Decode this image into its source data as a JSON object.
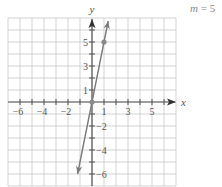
{
  "chart_data": {
    "type": "line",
    "title": "",
    "equation": "y = 5x",
    "annotation": {
      "text_var": "m",
      "text_eq": " = ",
      "text_val": "5"
    },
    "xlabel": "x",
    "ylabel": "y",
    "xlim": [
      -7,
      7
    ],
    "ylim": [
      -7,
      7
    ],
    "grid": true,
    "x_tick_labels": [
      {
        "value": -6,
        "label": "−6"
      },
      {
        "value": -4,
        "label": "−4"
      },
      {
        "value": -2,
        "label": "−2"
      },
      {
        "value": 1,
        "label": "1"
      },
      {
        "value": 3,
        "label": "3"
      },
      {
        "value": 5,
        "label": "5"
      }
    ],
    "y_tick_labels": [
      {
        "value": 5,
        "label": "5"
      },
      {
        "value": 3,
        "label": "3"
      },
      {
        "value": 1,
        "label": "1"
      },
      {
        "value": -2,
        "label": "−2"
      },
      {
        "value": -4,
        "label": "−4"
      },
      {
        "value": -6,
        "label": "−6"
      }
    ],
    "series": [
      {
        "name": "y = 5x",
        "slope": 5,
        "intercept": 0,
        "x_range": [
          -1.2,
          1.35
        ],
        "points": [
          {
            "x": 0,
            "y": 0
          },
          {
            "x": 1,
            "y": 5
          }
        ],
        "arrows": "both"
      }
    ]
  },
  "colors": {
    "grid": "#c8c8c8",
    "axis": "#555555",
    "line": "#7a7a7a",
    "point": "#8a8a8a",
    "text": "#555555",
    "annotation": "#8a8a8a"
  },
  "layout": {
    "origin_x": 92,
    "origin_y": 102,
    "unit": 12
  }
}
